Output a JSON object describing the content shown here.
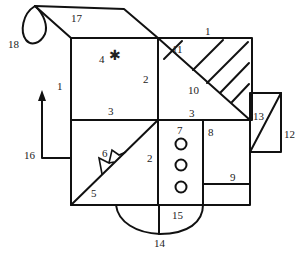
{
  "diagram": {
    "type": "complex-figure",
    "labels": {
      "l1_left": "1",
      "l1_top": "1",
      "l2_upper": "2",
      "l2_lower": "2",
      "l3_left": "3",
      "l3_right": "3",
      "l4": "4",
      "l5": "5",
      "l6": "6",
      "l7": "7",
      "l8": "8",
      "l9": "9",
      "l10": "10",
      "l11": "11",
      "l12": "12",
      "l13": "13",
      "l14": "14",
      "l15": "15",
      "l16": "16",
      "l17": "17",
      "l18": "18"
    },
    "symbols": {
      "star": "✱"
    },
    "stroke_color": "#111111",
    "background": "#ffffff"
  }
}
